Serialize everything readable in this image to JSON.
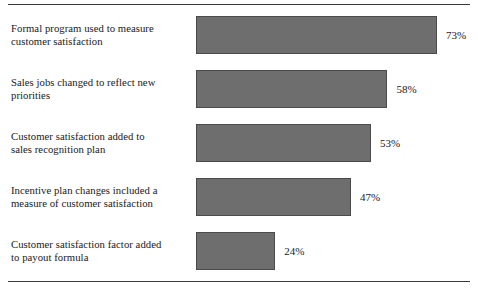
{
  "chart_data": {
    "type": "bar",
    "orientation": "horizontal",
    "title": "",
    "subtitle": "",
    "xlabel": "",
    "ylabel": "",
    "xlim": [
      0,
      100
    ],
    "grid": false,
    "legend": null,
    "value_suffix": "%",
    "categories": [
      "Formal program used to measure customer satisfaction",
      "Sales jobs changed to reflect new priorities",
      "Customer satisfaction added to sales recognition plan",
      "Incentive plan changes included a measure of customer satisfaction",
      "Customer satisfaction factor added to payout formula"
    ],
    "values": [
      73,
      58,
      53,
      47,
      24
    ],
    "data_labels": [
      "73%",
      "58%",
      "53%",
      "47%",
      "24%"
    ],
    "bar_color": "#6e6e6e",
    "bar_border_color": "#4a4a4a",
    "rows": [
      {
        "label_line1": "Formal program used to measure",
        "label_line2": "customer satisfaction",
        "value": 73,
        "value_label": "73%"
      },
      {
        "label_line1": "Sales jobs changed to reflect new",
        "label_line2": "priorities",
        "value": 58,
        "value_label": "58%"
      },
      {
        "label_line1": "Customer satisfaction added to",
        "label_line2": "sales recognition plan",
        "value": 53,
        "value_label": "53%"
      },
      {
        "label_line1": "Incentive plan changes included a",
        "label_line2": "measure of customer satisfaction",
        "value": 47,
        "value_label": "47%"
      },
      {
        "label_line1": "Customer satisfaction factor added",
        "label_line2": "to payout formula",
        "value": 24,
        "value_label": "24%"
      }
    ]
  }
}
